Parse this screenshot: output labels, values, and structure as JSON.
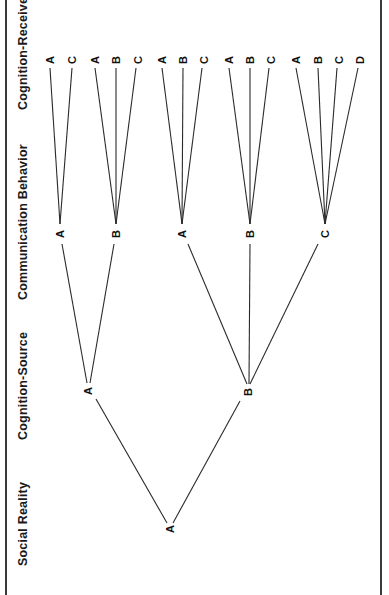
{
  "diagram": {
    "levels": [
      {
        "id": "cognition-receiver",
        "label": "Cognition-Receiver"
      },
      {
        "id": "communication-behavior",
        "label": "Communication Behavior"
      },
      {
        "id": "cognition-source",
        "label": "Cognition-Source"
      },
      {
        "id": "social-reality",
        "label": "Social Reality"
      }
    ],
    "nodes": {
      "social_reality": [
        {
          "label": "A",
          "x": 170,
          "y": 528
        }
      ],
      "cognition_source": [
        {
          "label": "A",
          "x": 88,
          "y": 390
        },
        {
          "label": "B",
          "x": 247,
          "y": 392
        }
      ],
      "communication_behavior": [
        {
          "label": "A",
          "x": 60,
          "y": 234
        },
        {
          "label": "B",
          "x": 116,
          "y": 234
        },
        {
          "label": "A",
          "x": 182,
          "y": 234
        },
        {
          "label": "B",
          "x": 250,
          "y": 234
        },
        {
          "label": "C",
          "x": 325,
          "y": 234
        }
      ],
      "cognition_receiver": [
        {
          "label": "A",
          "x": 50,
          "y": 60
        },
        {
          "label": "C",
          "x": 72,
          "y": 60
        },
        {
          "label": "A",
          "x": 95,
          "y": 60
        },
        {
          "label": "B",
          "x": 116,
          "y": 60
        },
        {
          "label": "C",
          "x": 138,
          "y": 60
        },
        {
          "label": "A",
          "x": 162,
          "y": 60
        },
        {
          "label": "B",
          "x": 183,
          "y": 60
        },
        {
          "label": "C",
          "x": 204,
          "y": 60
        },
        {
          "label": "A",
          "x": 229,
          "y": 60
        },
        {
          "label": "B",
          "x": 250,
          "y": 60
        },
        {
          "label": "C",
          "x": 271,
          "y": 60
        },
        {
          "label": "A",
          "x": 296,
          "y": 60
        },
        {
          "label": "B",
          "x": 318,
          "y": 60
        },
        {
          "label": "C",
          "x": 339,
          "y": 60
        },
        {
          "label": "D",
          "x": 360,
          "y": 60
        }
      ]
    },
    "edges": [
      {
        "from": "SR-A",
        "to": "CS-A"
      },
      {
        "from": "SR-A",
        "to": "CS-B"
      },
      {
        "from": "CS-A",
        "to": "CB-A1"
      },
      {
        "from": "CS-A",
        "to": "CB-B1"
      },
      {
        "from": "CS-B",
        "to": "CB-A2"
      },
      {
        "from": "CS-B",
        "to": "CB-B2"
      },
      {
        "from": "CS-B",
        "to": "CB-C"
      },
      {
        "from": "CB-A1",
        "to": [
          "A",
          "C"
        ]
      },
      {
        "from": "CB-B1",
        "to": [
          "A",
          "B",
          "C"
        ]
      },
      {
        "from": "CB-A2",
        "to": [
          "A",
          "B",
          "C"
        ]
      },
      {
        "from": "CB-B2",
        "to": [
          "A",
          "B",
          "C"
        ]
      },
      {
        "from": "CB-C",
        "to": [
          "A",
          "B",
          "C",
          "D"
        ]
      }
    ],
    "style": {
      "line_color": "#2a2a2a",
      "border_color": "#3a3a3a",
      "background": "#ffffff"
    }
  }
}
